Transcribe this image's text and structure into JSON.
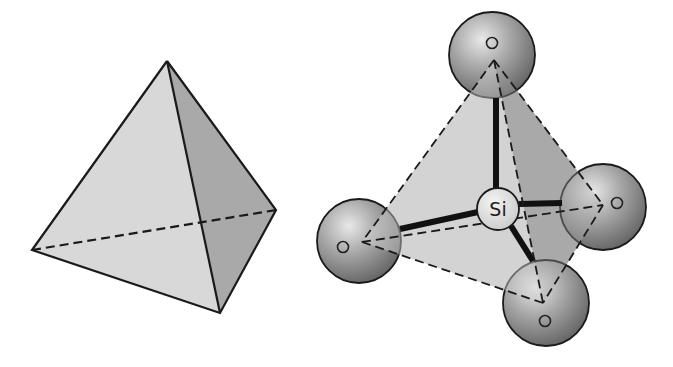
{
  "figure": {
    "left_panel": {
      "name": "tetrahedron",
      "vertices": {
        "apex": [
          167,
          61
        ],
        "left": [
          32,
          250
        ],
        "bottom": [
          220,
          313
        ],
        "right": [
          276,
          210
        ]
      },
      "colors": {
        "front_face": "#d9d9d9",
        "side_face": "#a8a8a8",
        "edge": "#1a1a1a"
      }
    },
    "right_panel": {
      "name": "silicate-tetrahedron",
      "center_atom": {
        "label": "Si",
        "cx": 498,
        "cy": 209,
        "r": 21
      },
      "oxygen_atoms": [
        {
          "label": "O",
          "cx": 492,
          "cy": 55,
          "r": 43,
          "vertex": [
            494,
            60
          ]
        },
        {
          "label": "O",
          "cx": 359,
          "cy": 241,
          "r": 42,
          "vertex": [
            362,
            242
          ]
        },
        {
          "label": "O",
          "cx": 603,
          "cy": 207,
          "r": 43,
          "vertex": [
            603,
            205
          ]
        },
        {
          "label": "O",
          "cx": 546,
          "cy": 303,
          "r": 43,
          "vertex": [
            543,
            303
          ]
        }
      ],
      "colors": {
        "light_face": "#d4d4d4",
        "dark_face": "#a9a9a9",
        "sphere_light": "#e6e6e6",
        "sphere_dark": "#6e6e6e",
        "bond": "#111111"
      }
    }
  }
}
